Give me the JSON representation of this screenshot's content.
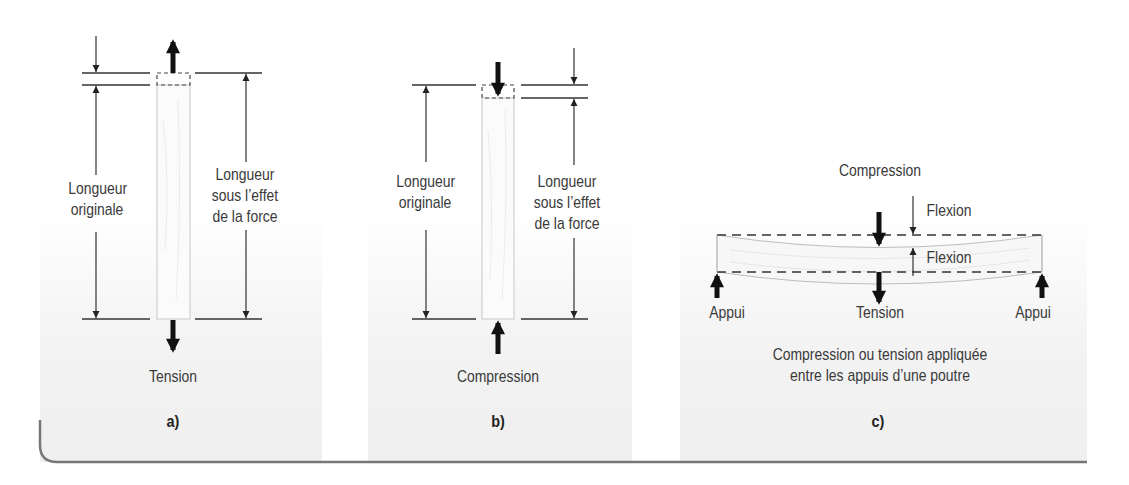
{
  "figure": {
    "panels": [
      {
        "id": "a",
        "caption": "a)",
        "force_label": "Tension",
        "left_label_line1": "Longueur",
        "left_label_line2": "originale",
        "right_label_line1": "Longueur",
        "right_label_line2": "sous l’effet",
        "right_label_line3": "de la force"
      },
      {
        "id": "b",
        "caption": "b)",
        "force_label": "Compression",
        "left_label_line1": "Longueur",
        "left_label_line2": "originale",
        "right_label_line1": "Longueur",
        "right_label_line2": "sous l’effet",
        "right_label_line3": "de la force"
      },
      {
        "id": "c",
        "caption": "c)",
        "top_label": "Compression",
        "flexion_top": "Flexion",
        "flexion_bottom": "Flexion",
        "support_left": "Appui",
        "center_label": "Tension",
        "support_right": "Appui",
        "description_line1": "Compression ou tension appliquée",
        "description_line2": "entre les appuis d’une poutre"
      }
    ],
    "colors": {
      "line": "#333333",
      "text": "#3a3a3a",
      "frame": "#777777"
    }
  }
}
